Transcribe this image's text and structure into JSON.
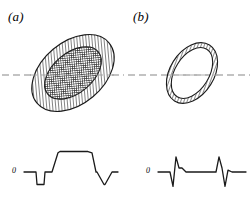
{
  "figure": {
    "background_color": "#ffffff",
    "ink_color": "#1a1a1a",
    "dashed_line_color": "#b0b0b0",
    "panels": [
      {
        "id": "a",
        "label": "(a)",
        "object_type": "filled-nested-ellipse",
        "zero_label": "0",
        "outer_ellipse": {
          "center_x": 73,
          "center_y": 73,
          "radius_x": 47,
          "radius_y": 31,
          "rotation_deg": -40,
          "fill": "diagonal-hatch",
          "hatch_color": "#3a3a3a",
          "hatch_spacing_px": 3,
          "stroke_color": "#1a1a1a",
          "stroke_width": 1.1
        },
        "inner_ellipse": {
          "center_x": 73,
          "center_y": 73,
          "radius_x": 33,
          "radius_y": 20,
          "rotation_deg": -40,
          "fill": "cross-hatch",
          "hatch_color": "#2a2a2a",
          "hatch_spacing_px": 2.2,
          "stroke_color": "#1a1a1a",
          "stroke_width": 1.1
        },
        "scan_line": {
          "y": 75,
          "x_start": 2,
          "x_end": 124,
          "dash": "7 4",
          "color": "#b0b0b0",
          "width": 1.4
        }
      },
      {
        "id": "b",
        "label": "(b)",
        "object_type": "hollow-annulus",
        "zero_label": "0",
        "outer_ellipse": {
          "center_x": 192,
          "center_y": 73,
          "radius_x": 33,
          "radius_y": 22,
          "rotation_deg": -58,
          "fill": "diagonal-hatch",
          "hatch_color": "#3a3a3a",
          "hatch_spacing_px": 3,
          "stroke_color": "#1a1a1a",
          "stroke_width": 1.1
        },
        "inner_ellipse": {
          "center_x": 192,
          "center_y": 73,
          "radius_x": 28,
          "radius_y": 17,
          "rotation_deg": -58,
          "fill": "white",
          "stroke_color": "#1a1a1a",
          "stroke_width": 1.1
        },
        "scan_line": {
          "y": 75,
          "x_start": 128,
          "x_end": 250,
          "dash": "7 4",
          "color": "#b0b0b0",
          "width": 1.4
        }
      }
    ]
  },
  "chart_data": [
    {
      "type": "line",
      "id": "profile-a",
      "title": "",
      "xlabel": "",
      "ylabel": "",
      "baseline_label": "0",
      "description": "Broad flat-topped trapezoidal profile with narrow negative dips flanking the central plateau",
      "xlim": [
        24,
        118
      ],
      "ylim": [
        -1.0,
        1.35
      ],
      "baseline_value": 0,
      "x": [
        24,
        36,
        37,
        44,
        45,
        52,
        58,
        60,
        88,
        92,
        96,
        97,
        104,
        105,
        112,
        118
      ],
      "y": [
        0,
        0,
        -0.78,
        -0.78,
        0,
        0,
        1.2,
        1.28,
        1.28,
        1.2,
        0,
        0,
        -0.78,
        -0.78,
        0,
        0
      ],
      "stroke_color": "#1a1a1a",
      "stroke_width": 1.3,
      "grid": false,
      "legend": false
    },
    {
      "type": "line",
      "id": "profile-b",
      "title": "",
      "xlabel": "",
      "ylabel": "",
      "baseline_label": "0",
      "description": "Flat baseline interrupted by two sharp bipolar spikes at the annulus edges",
      "xlim": [
        158,
        252
      ],
      "ylim": [
        -1.0,
        1.35
      ],
      "baseline_value": 0,
      "x": [
        158,
        170,
        173,
        176,
        179,
        182,
        186,
        216,
        219,
        222,
        225,
        228,
        232,
        246
      ],
      "y": [
        0,
        0,
        -0.9,
        0.95,
        0.25,
        0.25,
        0,
        0,
        0.95,
        0.25,
        -0.9,
        0.12,
        0,
        0
      ],
      "stroke_color": "#1a1a1a",
      "stroke_width": 1.3,
      "grid": false,
      "legend": false
    }
  ]
}
